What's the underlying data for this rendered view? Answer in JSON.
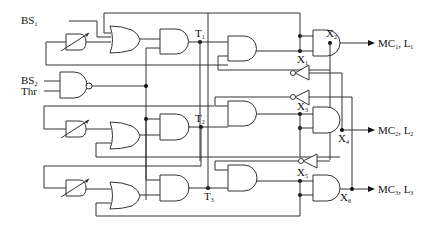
{
  "diagram": {
    "type": "logic-circuit",
    "inputs": [
      {
        "id": "bs1",
        "label": "BS",
        "sub": "1"
      },
      {
        "id": "bs2",
        "label": "BS",
        "sub": "2"
      },
      {
        "id": "thr",
        "label": "Thr",
        "sub": ""
      }
    ],
    "nodes": [
      {
        "id": "t1",
        "label": "T",
        "sub": "1"
      },
      {
        "id": "t2",
        "label": "T",
        "sub": "2"
      },
      {
        "id": "t3",
        "label": "T",
        "sub": "3"
      },
      {
        "id": "x1",
        "label": "X",
        "sub": "1"
      },
      {
        "id": "x2",
        "label": "X",
        "sub": "2"
      },
      {
        "id": "x3",
        "label": "X",
        "sub": "3"
      },
      {
        "id": "x4",
        "label": "X",
        "sub": "4"
      },
      {
        "id": "x5",
        "label": "X",
        "sub": "5"
      },
      {
        "id": "x6",
        "label": "X",
        "sub": "6"
      }
    ],
    "outputs": [
      {
        "id": "out1",
        "label": "MC",
        "sub": "1",
        "label2": "L",
        "sub2": "1"
      },
      {
        "id": "out2",
        "label": "MC",
        "sub": "2",
        "label2": "L",
        "sub2": "2"
      },
      {
        "id": "out3",
        "label": "MC",
        "sub": "3",
        "label2": "L",
        "sub2": "3"
      }
    ],
    "gates": {
      "nor": 1,
      "delay_elements": 3,
      "or": 3,
      "and": 9,
      "inverters": 3
    }
  }
}
